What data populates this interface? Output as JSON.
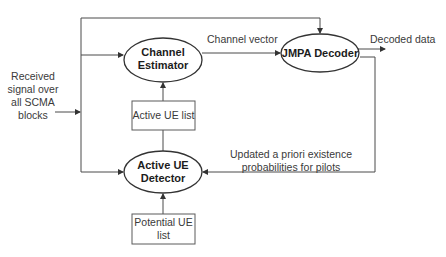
{
  "diagram": {
    "input_label": [
      "Received",
      "signal over",
      "all SCMA",
      "blocks"
    ],
    "nodes": {
      "channel_estimator": [
        "Channel",
        "Estimator"
      ],
      "jmpa_decoder": "JMPA Decoder",
      "active_ue_detector": [
        "Active UE",
        "Detector"
      ],
      "active_ue_list": "Active UE list",
      "potential_ue_list": [
        "Potential UE",
        "list"
      ]
    },
    "edges": {
      "channel_vector": "Channel vector",
      "decoded_data": "Decoded data",
      "feedback": [
        "Updated a priori existence",
        "probabilities for pilots"
      ]
    },
    "colors": {
      "line": "#4a4a4a",
      "text": "#3a3a3a",
      "background": "#ffffff"
    }
  }
}
